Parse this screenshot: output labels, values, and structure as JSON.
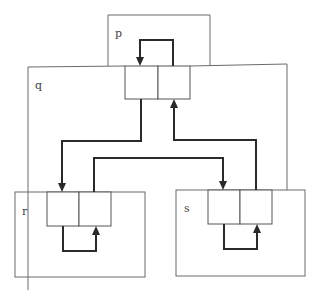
{
  "diagram": {
    "title": "",
    "nodes": [
      {
        "id": "p",
        "label": "p"
      },
      {
        "id": "q",
        "label": "q"
      },
      {
        "id": "r",
        "label": "r"
      },
      {
        "id": "s",
        "label": "s"
      }
    ],
    "colors": {
      "box_stroke": "#6a6a6a",
      "link_stroke": "#2a2a2a",
      "background": "#ffffff"
    }
  }
}
